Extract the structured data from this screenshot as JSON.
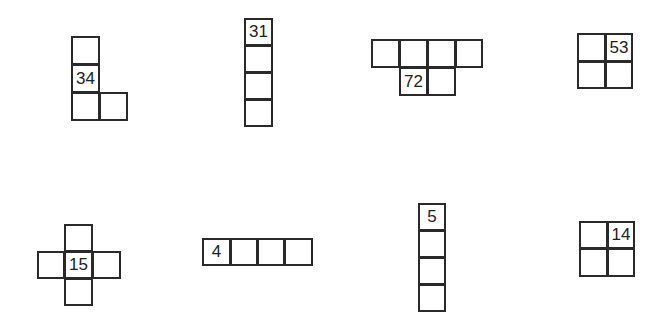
{
  "figure": {
    "line_color": "#2a2a2a",
    "shapes": [
      {
        "id": "shape-1",
        "label": "34",
        "type": "L-shape",
        "cells": [
          {
            "x": 71,
            "y": 36,
            "w": 29,
            "h": 29,
            "text": ""
          },
          {
            "x": 71,
            "y": 64,
            "w": 29,
            "h": 29,
            "text": "34"
          },
          {
            "x": 71,
            "y": 92,
            "w": 29,
            "h": 29,
            "text": ""
          },
          {
            "x": 99,
            "y": 92,
            "w": 29,
            "h": 29,
            "text": ""
          }
        ]
      },
      {
        "id": "shape-2",
        "label": "31",
        "type": "vertical-bar",
        "cells": [
          {
            "x": 244,
            "y": 18,
            "w": 29,
            "h": 28,
            "text": "31"
          },
          {
            "x": 244,
            "y": 45,
            "w": 29,
            "h": 28,
            "text": ""
          },
          {
            "x": 244,
            "y": 72,
            "w": 29,
            "h": 28,
            "text": ""
          },
          {
            "x": 244,
            "y": 99,
            "w": 29,
            "h": 28,
            "text": ""
          }
        ]
      },
      {
        "id": "shape-3",
        "label": "72",
        "type": "T-row",
        "cells": [
          {
            "x": 371,
            "y": 39,
            "w": 29,
            "h": 29,
            "text": ""
          },
          {
            "x": 399,
            "y": 39,
            "w": 29,
            "h": 29,
            "text": ""
          },
          {
            "x": 427,
            "y": 39,
            "w": 29,
            "h": 29,
            "text": ""
          },
          {
            "x": 455,
            "y": 39,
            "w": 28,
            "h": 29,
            "text": ""
          },
          {
            "x": 399,
            "y": 67,
            "w": 29,
            "h": 29,
            "text": "72"
          },
          {
            "x": 427,
            "y": 67,
            "w": 29,
            "h": 29,
            "text": ""
          }
        ]
      },
      {
        "id": "shape-4",
        "label": "53",
        "type": "2x2-square",
        "cells": [
          {
            "x": 577,
            "y": 33,
            "w": 29,
            "h": 29,
            "text": ""
          },
          {
            "x": 605,
            "y": 33,
            "w": 28,
            "h": 29,
            "text": "53"
          },
          {
            "x": 577,
            "y": 61,
            "w": 29,
            "h": 28,
            "text": ""
          },
          {
            "x": 605,
            "y": 61,
            "w": 28,
            "h": 28,
            "text": ""
          }
        ]
      },
      {
        "id": "shape-5",
        "label": "15",
        "type": "cross",
        "cells": [
          {
            "x": 64,
            "y": 224,
            "w": 29,
            "h": 28,
            "text": ""
          },
          {
            "x": 37,
            "y": 251,
            "w": 28,
            "h": 28,
            "text": ""
          },
          {
            "x": 64,
            "y": 251,
            "w": 29,
            "h": 28,
            "text": "15"
          },
          {
            "x": 92,
            "y": 251,
            "w": 29,
            "h": 28,
            "text": ""
          },
          {
            "x": 64,
            "y": 278,
            "w": 29,
            "h": 28,
            "text": ""
          }
        ]
      },
      {
        "id": "shape-6",
        "label": "4",
        "type": "horizontal-bar",
        "cells": [
          {
            "x": 202,
            "y": 238,
            "w": 29,
            "h": 28,
            "text": "4"
          },
          {
            "x": 230,
            "y": 238,
            "w": 28,
            "h": 28,
            "text": ""
          },
          {
            "x": 257,
            "y": 238,
            "w": 28,
            "h": 28,
            "text": ""
          },
          {
            "x": 284,
            "y": 238,
            "w": 29,
            "h": 28,
            "text": ""
          }
        ]
      },
      {
        "id": "shape-7",
        "label": "5",
        "type": "vertical-bar",
        "cells": [
          {
            "x": 418,
            "y": 203,
            "w": 28,
            "h": 28,
            "text": "5"
          },
          {
            "x": 418,
            "y": 230,
            "w": 28,
            "h": 28,
            "text": ""
          },
          {
            "x": 418,
            "y": 257,
            "w": 28,
            "h": 28,
            "text": ""
          },
          {
            "x": 418,
            "y": 284,
            "w": 28,
            "h": 28,
            "text": ""
          }
        ]
      },
      {
        "id": "shape-8",
        "label": "14",
        "type": "2x2-square",
        "cells": [
          {
            "x": 579,
            "y": 221,
            "w": 29,
            "h": 28,
            "text": ""
          },
          {
            "x": 607,
            "y": 221,
            "w": 28,
            "h": 28,
            "text": "14"
          },
          {
            "x": 579,
            "y": 248,
            "w": 29,
            "h": 29,
            "text": ""
          },
          {
            "x": 607,
            "y": 248,
            "w": 28,
            "h": 29,
            "text": ""
          }
        ]
      }
    ]
  }
}
